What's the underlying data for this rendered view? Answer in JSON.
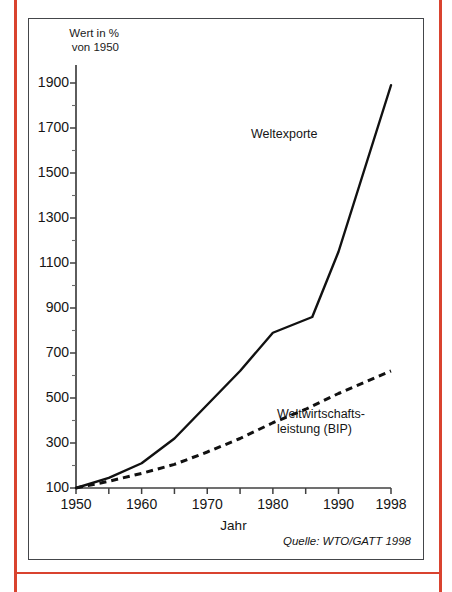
{
  "page": {
    "accent_color": "#d9432f",
    "frame_color": "#44464a",
    "ink_color": "#151515"
  },
  "chart_data": {
    "type": "line",
    "title": "",
    "xlabel": "Jahr",
    "ylabel": "Wert in %\nvon 1950",
    "ylabel_line1": "Wert in %",
    "ylabel_line2": "von 1950",
    "xlim": [
      1950,
      1998
    ],
    "ylim": [
      100,
      1900
    ],
    "yticks": [
      100,
      300,
      500,
      700,
      900,
      1100,
      1300,
      1500,
      1700,
      1900
    ],
    "ytick_labels": [
      "100",
      "300",
      "500",
      "700",
      "900",
      "1100",
      "1300",
      "1500",
      "1700",
      "1900"
    ],
    "yminor_ticks": [
      200,
      400,
      600,
      800,
      1000,
      1200,
      1400,
      1600,
      1800
    ],
    "xticks": [
      1950,
      1955,
      1960,
      1965,
      1970,
      1975,
      1980,
      1985,
      1990,
      1998
    ],
    "xtick_labels": [
      {
        "year": 1950,
        "label": "1950"
      },
      {
        "year": 1960,
        "label": "1960"
      },
      {
        "year": 1970,
        "label": "1970"
      },
      {
        "year": 1980,
        "label": "1980"
      },
      {
        "year": 1990,
        "label": "1990"
      },
      {
        "year": 1998,
        "label": "1998"
      }
    ],
    "grid": false,
    "legend": "inline-annotations",
    "series": [
      {
        "name": "Weltexporte",
        "style": "solid",
        "label_text": "Weltexporte",
        "x": [
          1950,
          1955,
          1960,
          1965,
          1970,
          1975,
          1980,
          1986,
          1990,
          1998
        ],
        "values": [
          100,
          145,
          210,
          320,
          470,
          620,
          790,
          860,
          1150,
          1890
        ]
      },
      {
        "name": "Weltwirtschaftsleistung (BIP)",
        "style": "dashed",
        "label_text": "Weltwirtschafts-\nleistung (BIP)",
        "label_line1": "Weltwirtschafts-",
        "label_line2": "leistung (BIP)",
        "x": [
          1950,
          1955,
          1960,
          1965,
          1970,
          1975,
          1980,
          1985,
          1990,
          1998
        ],
        "values": [
          100,
          130,
          165,
          205,
          260,
          320,
          390,
          450,
          520,
          620
        ]
      }
    ],
    "source_note": "Quelle: WTO/GATT 1998"
  }
}
